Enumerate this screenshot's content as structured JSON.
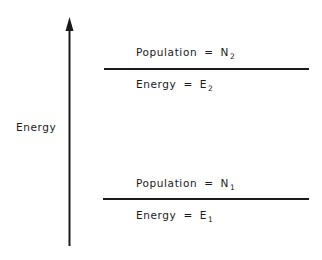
{
  "diagram": {
    "type": "energy-level-diagram",
    "axis": {
      "label": "Energy",
      "direction": "up"
    },
    "levels": [
      {
        "name": "upper",
        "population_label": "Population",
        "population_symbol": "N",
        "population_subscript": "2",
        "energy_label": "Energy",
        "energy_symbol": "E",
        "energy_subscript": "2",
        "equals": "="
      },
      {
        "name": "lower",
        "population_label": "Population",
        "population_symbol": "N",
        "population_subscript": "1",
        "energy_label": "Energy",
        "energy_symbol": "E",
        "energy_subscript": "1",
        "equals": "="
      }
    ],
    "colors": {
      "ink": "#1a1a1a",
      "background": "#ffffff"
    }
  }
}
